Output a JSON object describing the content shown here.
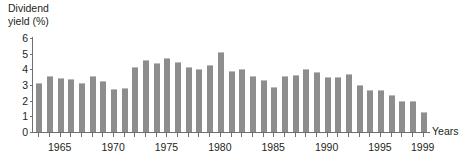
{
  "chart": {
    "type": "bar",
    "ylabel_text": "Dividend\nyield (%)",
    "xlabel_text": "Years"
  },
  "chart_data": {
    "type": "bar",
    "title": "",
    "subtitle": "",
    "ylabel": "Dividend yield (%)",
    "xlabel": "Years",
    "ylim": [
      0,
      6
    ],
    "ytick_labels": [
      "0",
      "1",
      "2",
      "3",
      "4",
      "5",
      "6"
    ],
    "ytick_values": [
      0,
      1,
      2,
      3,
      4,
      5,
      6
    ],
    "grid": false,
    "legend": "none",
    "bar_color": "#8d8d8d",
    "axis_color": "#6f6f6f",
    "xtick_labels": [
      "1965",
      "1970",
      "1975",
      "1980",
      "1985",
      "1990",
      "1995",
      "1999"
    ],
    "xtick_label_years": [
      1965,
      1970,
      1975,
      1980,
      1985,
      1990,
      1995,
      1999
    ],
    "x_range": [
      1963,
      1999
    ],
    "categories": [
      "1963",
      "1964",
      "1965",
      "1966",
      "1967",
      "1968",
      "1969",
      "1970",
      "1971",
      "1972",
      "1973",
      "1974",
      "1975",
      "1976",
      "1977",
      "1978",
      "1979",
      "1980",
      "1981",
      "1982",
      "1983",
      "1984",
      "1985",
      "1986",
      "1987",
      "1988",
      "1989",
      "1990",
      "1991",
      "1992",
      "1993",
      "1994",
      "1995",
      "1996",
      "1997",
      "1998",
      "1999"
    ],
    "values": [
      3.1,
      3.55,
      3.45,
      3.4,
      3.15,
      3.6,
      3.25,
      2.75,
      2.8,
      4.15,
      4.6,
      4.4,
      4.75,
      4.45,
      4.15,
      4.0,
      4.3,
      5.1,
      3.9,
      4.05,
      3.6,
      3.3,
      2.9,
      3.6,
      3.65,
      4.05,
      3.8,
      3.5,
      3.5,
      3.7,
      3.0,
      2.65,
      2.7,
      2.35,
      2.0,
      2.0,
      1.25
    ]
  }
}
